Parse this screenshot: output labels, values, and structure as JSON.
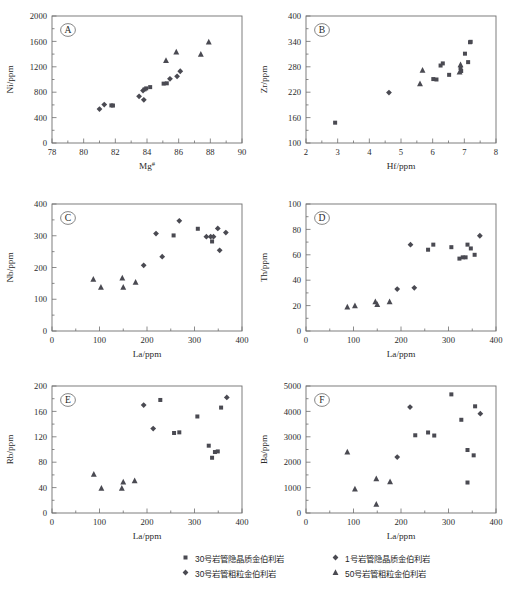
{
  "figure": {
    "width": 508,
    "height": 594,
    "marker_color": "#4a4a52",
    "axis_color": "#6f6f6f"
  },
  "legend": {
    "position": "bottom",
    "columns": [
      {
        "entries": [
          {
            "marker": "square",
            "label": "30号岩管隐晶质金伯利岩"
          },
          {
            "marker": "diamond",
            "label": "30号岩管粗粒金伯利岩"
          }
        ]
      },
      {
        "entries": [
          {
            "marker": "diamond",
            "label": "1号岩管隐晶质金伯利岩"
          },
          {
            "marker": "triangle",
            "label": "50号岩管粗粒金伯利岩"
          }
        ]
      }
    ]
  },
  "chart_data": [
    {
      "id": "A",
      "type": "scatter",
      "panel_label": "A",
      "title": "",
      "xlabel": "Mg#",
      "ylabel": "Ni/ppm",
      "xlim": [
        78,
        90
      ],
      "ylim": [
        0,
        2000
      ],
      "xticks": [
        78,
        80,
        82,
        84,
        86,
        88,
        90
      ],
      "yticks": [
        0,
        400,
        800,
        1200,
        1600,
        2000
      ],
      "xtick_labels": [
        "78",
        "80",
        "82",
        "84",
        "86",
        "88",
        "90"
      ],
      "ytick_labels": [
        "0",
        "400",
        "800",
        "1200",
        "1600",
        "2000"
      ],
      "grid": false,
      "series": [
        {
          "name": "30号岩管隐晶质金伯利岩",
          "marker": "square",
          "points": [
            [
              81.85,
              590
            ],
            [
              81.75,
              592
            ],
            [
              83.85,
              845
            ],
            [
              83.95,
              860
            ],
            [
              84.2,
              880
            ],
            [
              85.05,
              935
            ],
            [
              85.25,
              940
            ]
          ]
        },
        {
          "name": "30号岩管粗粒金伯利岩",
          "marker": "diamond",
          "points": [
            [
              81.0,
              535
            ],
            [
              81.3,
              605
            ],
            [
              83.5,
              735
            ],
            [
              83.75,
              825
            ],
            [
              83.8,
              680
            ],
            [
              85.45,
              1010
            ],
            [
              85.9,
              1050
            ],
            [
              86.1,
              1130
            ]
          ]
        },
        {
          "name": "50号岩管粗粒金伯利岩",
          "marker": "triangle",
          "points": [
            [
              85.2,
              1300
            ],
            [
              85.85,
              1435
            ],
            [
              87.4,
              1400
            ],
            [
              87.9,
              1590
            ]
          ]
        }
      ]
    },
    {
      "id": "B",
      "type": "scatter",
      "panel_label": "B",
      "title": "",
      "xlabel": "Hf/ppm",
      "ylabel": "Zr/ppm",
      "xlim": [
        2,
        8
      ],
      "ylim": [
        100,
        400
      ],
      "xticks": [
        2,
        3,
        4,
        5,
        6,
        7,
        8
      ],
      "yticks": [
        100,
        160,
        220,
        280,
        340,
        400
      ],
      "xtick_labels": [
        "2",
        "3",
        "4",
        "5",
        "6",
        "7",
        "8"
      ],
      "ytick_labels": [
        "100",
        "160",
        "220",
        "280",
        "340",
        "400"
      ],
      "grid": false,
      "series": [
        {
          "name": "30号岩管隐晶质金伯利岩",
          "marker": "square",
          "points": [
            [
              2.92,
              148
            ],
            [
              6.02,
              251
            ],
            [
              6.12,
              250
            ],
            [
              6.25,
              283
            ],
            [
              6.32,
              288
            ],
            [
              6.52,
              261
            ],
            [
              6.9,
              270
            ],
            [
              6.88,
              277
            ],
            [
              7.02,
              311
            ],
            [
              7.12,
              291
            ],
            [
              7.18,
              338
            ],
            [
              7.2,
              339
            ]
          ]
        },
        {
          "name": "1号岩管隐晶质金伯利岩",
          "marker": "diamond",
          "points": [
            [
              4.62,
              219
            ]
          ]
        },
        {
          "name": "50号岩管粗粒金伯利岩",
          "marker": "triangle",
          "points": [
            [
              5.6,
              240
            ],
            [
              5.68,
              272
            ],
            [
              6.85,
              268
            ],
            [
              6.88,
              285
            ]
          ]
        }
      ]
    },
    {
      "id": "C",
      "type": "scatter",
      "panel_label": "C",
      "title": "",
      "xlabel": "La/ppm",
      "ylabel": "Nb/ppm",
      "xlim": [
        0,
        400
      ],
      "ylim": [
        0,
        400
      ],
      "xticks": [
        0,
        100,
        200,
        300,
        400
      ],
      "yticks": [
        0,
        100,
        200,
        300,
        400
      ],
      "xtick_labels": [
        "0",
        "100",
        "200",
        "300",
        "400"
      ],
      "ytick_labels": [
        "0",
        "100",
        "200",
        "300",
        "400"
      ],
      "grid": false,
      "series": [
        {
          "name": "30号岩管隐晶质金伯利岩",
          "marker": "square",
          "points": [
            [
              256,
              301
            ],
            [
              307,
              322
            ],
            [
              337,
              282
            ]
          ]
        },
        {
          "name": "30号岩管粗粒金伯利岩",
          "marker": "diamond",
          "points": [
            [
              193,
              207
            ],
            [
              219,
              307
            ],
            [
              232,
              234
            ],
            [
              268,
              347
            ],
            [
              325,
              297
            ],
            [
              334,
              297
            ],
            [
              340,
              297
            ],
            [
              349,
              323
            ],
            [
              353,
              254
            ],
            [
              366,
              310
            ]
          ]
        },
        {
          "name": "50号岩管粗粒金伯利岩",
          "marker": "triangle",
          "points": [
            [
              87,
              163
            ],
            [
              103,
              138
            ],
            [
              148,
              167
            ],
            [
              150,
              138
            ],
            [
              176,
              154
            ]
          ]
        }
      ]
    },
    {
      "id": "D",
      "type": "scatter",
      "panel_label": "D",
      "title": "",
      "xlabel": "La/ppm",
      "ylabel": "Th/ppm",
      "xlim": [
        0,
        400
      ],
      "ylim": [
        0,
        100
      ],
      "xticks": [
        0,
        100,
        200,
        300,
        400
      ],
      "yticks": [
        0,
        20,
        40,
        60,
        80,
        100
      ],
      "xtick_labels": [
        "0",
        "100",
        "200",
        "300",
        "400"
      ],
      "ytick_labels": [
        "0",
        "20",
        "40",
        "60",
        "80",
        "100"
      ],
      "grid": false,
      "series": [
        {
          "name": "30号岩管隐晶质金伯利岩",
          "marker": "square",
          "points": [
            [
              257,
              64
            ],
            [
              268,
              68
            ],
            [
              306,
              66
            ],
            [
              323,
              57
            ],
            [
              330,
              58
            ],
            [
              336,
              58
            ],
            [
              340,
              68
            ],
            [
              347,
              65
            ],
            [
              355,
              60
            ]
          ]
        },
        {
          "name": "30号岩管粗粒金伯利岩",
          "marker": "diamond",
          "points": [
            [
              192,
              33
            ],
            [
              220,
              68
            ],
            [
              228,
              34
            ],
            [
              366,
              75
            ]
          ]
        },
        {
          "name": "50号岩管粗粒金伯利岩",
          "marker": "triangle",
          "points": [
            [
              87,
              19
            ],
            [
              103,
              20
            ],
            [
              146,
              23
            ],
            [
              150,
              21
            ],
            [
              176,
              23
            ]
          ]
        }
      ]
    },
    {
      "id": "E",
      "type": "scatter",
      "panel_label": "E",
      "title": "",
      "xlabel": "La/ppm",
      "ylabel": "Rb/ppm",
      "xlim": [
        0,
        400
      ],
      "ylim": [
        0,
        200
      ],
      "xticks": [
        0,
        100,
        200,
        300,
        400
      ],
      "yticks": [
        0,
        40,
        80,
        120,
        160,
        200
      ],
      "xtick_labels": [
        "0",
        "100",
        "200",
        "300",
        "400"
      ],
      "ytick_labels": [
        "0",
        "40",
        "80",
        "120",
        "160",
        "200"
      ],
      "grid": false,
      "series": [
        {
          "name": "30号岩管隐晶质金伯利岩",
          "marker": "square",
          "points": [
            [
              228,
              178
            ],
            [
              257,
              126
            ],
            [
              268,
              127
            ],
            [
              306,
              152
            ],
            [
              330,
              106
            ],
            [
              337,
              87
            ],
            [
              343,
              96
            ],
            [
              349,
              97
            ],
            [
              356,
              166
            ]
          ]
        },
        {
          "name": "30号岩管粗粒金伯利岩",
          "marker": "diamond",
          "points": [
            [
              193,
              170
            ],
            [
              213,
              133
            ],
            [
              368,
              182
            ]
          ]
        },
        {
          "name": "50号岩管粗粒金伯利岩",
          "marker": "triangle",
          "points": [
            [
              88,
              61
            ],
            [
              104,
              39
            ],
            [
              147,
              39
            ],
            [
              150,
              49
            ],
            [
              174,
              51
            ]
          ]
        }
      ]
    },
    {
      "id": "F",
      "type": "scatter",
      "panel_label": "F",
      "title": "",
      "xlabel": "La/ppm",
      "ylabel": "Ba/ppm",
      "xlim": [
        0,
        400
      ],
      "ylim": [
        0,
        5000
      ],
      "xticks": [
        0,
        100,
        200,
        300,
        400
      ],
      "yticks": [
        0,
        1000,
        2000,
        3000,
        4000,
        5000
      ],
      "xtick_labels": [
        "0",
        "100",
        "200",
        "300",
        "400"
      ],
      "ytick_labels": [
        "0",
        "1000",
        "2000",
        "3000",
        "4000",
        "5000"
      ],
      "grid": false,
      "series": [
        {
          "name": "30号岩管隐晶质金伯利岩",
          "marker": "square",
          "points": [
            [
              230,
              3060
            ],
            [
              257,
              3170
            ],
            [
              270,
              3050
            ],
            [
              306,
              4670
            ],
            [
              327,
              3670
            ],
            [
              340,
              2480
            ],
            [
              340,
              1200
            ],
            [
              353,
              2270
            ],
            [
              356,
              4200
            ]
          ]
        },
        {
          "name": "30号岩管粗粒金伯利岩",
          "marker": "diamond",
          "points": [
            [
              192,
              2200
            ],
            [
              219,
              4170
            ],
            [
              367,
              3910
            ]
          ]
        },
        {
          "name": "50号岩管粗粒金伯利岩",
          "marker": "triangle",
          "points": [
            [
              87,
              2400
            ],
            [
              103,
              950
            ],
            [
              148,
              1350
            ],
            [
              148,
              350
            ],
            [
              177,
              1230
            ]
          ]
        }
      ]
    }
  ]
}
